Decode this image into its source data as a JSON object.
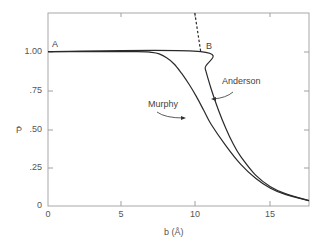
{
  "chart_data": {
    "type": "line",
    "title": "",
    "xlabel": "b (Å)",
    "ylabel": "P̄",
    "xlim": [
      0,
      17.6
    ],
    "ylim": [
      0,
      1.25
    ],
    "grid": false,
    "legend": "inline labels",
    "x_ticks": [
      "0",
      "5",
      "10",
      "15"
    ],
    "y_ticks": [
      "0",
      ".25",
      ".50",
      ".75",
      "1.00"
    ],
    "annotations": [
      {
        "text": "A",
        "x": 0.3,
        "y": 1.03
      },
      {
        "text": "B",
        "x": 10.6,
        "y": 1.03
      },
      {
        "text": "Murphy",
        "x": 7.9,
        "y": 0.73
      },
      {
        "text": "Anderson",
        "x": 12.2,
        "y": 0.82
      }
    ],
    "series": [
      {
        "name": "Murphy",
        "style": "solid",
        "x": [
          0,
          6.0,
          7.0,
          7.5,
          8.0,
          8.5,
          9.0,
          9.5,
          10.0,
          10.5,
          11.0,
          12.0,
          13.0,
          14.0,
          15.0,
          16.0,
          17.6
        ],
        "y": [
          1.0,
          1.0,
          0.995,
          0.985,
          0.96,
          0.92,
          0.86,
          0.79,
          0.71,
          0.62,
          0.53,
          0.39,
          0.27,
          0.18,
          0.115,
          0.075,
          0.035
        ]
      },
      {
        "name": "Anderson",
        "style": "solid",
        "x": [
          0,
          10.3,
          10.6,
          11.0,
          11.5,
          12.0,
          12.5,
          13.0,
          14.0,
          15.0,
          16.0,
          17.6
        ],
        "y": [
          1.0,
          1.0,
          0.89,
          0.76,
          0.62,
          0.5,
          0.4,
          0.32,
          0.2,
          0.125,
          0.08,
          0.035
        ]
      },
      {
        "name": "Anderson extrapolation",
        "style": "dashed",
        "x": [
          9.9,
          10.3
        ],
        "y": [
          1.25,
          1.0
        ]
      }
    ]
  },
  "labels": {
    "point_a": "A",
    "point_b": "B",
    "murphy": "Murphy",
    "anderson": "Anderson",
    "x_axis_title": "b (Å)",
    "y_axis_title": "P̄",
    "x_ticks": [
      "0",
      "5",
      "10",
      "15"
    ],
    "y_ticks": [
      "1.00",
      ".75",
      ".50",
      ".25",
      "0"
    ]
  },
  "colors": {
    "axis": "#9a9a9a",
    "curve": "#2a2a2a",
    "text": "#555555"
  }
}
